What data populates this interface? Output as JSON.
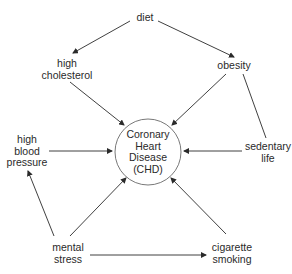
{
  "diagram": {
    "center_node": {
      "id": "chd",
      "lines": [
        "Coronary",
        "Heart",
        "Disease",
        "(CHD)"
      ]
    },
    "nodes": [
      {
        "id": "diet",
        "lines": [
          "diet"
        ]
      },
      {
        "id": "high-cholesterol",
        "lines": [
          "high",
          "cholesterol"
        ]
      },
      {
        "id": "obesity",
        "lines": [
          "obesity"
        ]
      },
      {
        "id": "high-blood-pressure",
        "lines": [
          "high",
          "blood",
          "pressure"
        ]
      },
      {
        "id": "sedentary-life",
        "lines": [
          "sedentary",
          "life"
        ]
      },
      {
        "id": "mental-stress",
        "lines": [
          "mental",
          "stress"
        ]
      },
      {
        "id": "cigarette-smoking",
        "lines": [
          "cigarette",
          "smoking"
        ]
      }
    ],
    "edges": [
      {
        "from": "diet",
        "to": "high-cholesterol"
      },
      {
        "from": "diet",
        "to": "obesity"
      },
      {
        "from": "high-cholesterol",
        "to": "chd"
      },
      {
        "from": "obesity",
        "to": "chd"
      },
      {
        "from": "obesity",
        "to": "sedentary-life",
        "arrow": false
      },
      {
        "from": "high-blood-pressure",
        "to": "chd"
      },
      {
        "from": "sedentary-life",
        "to": "chd"
      },
      {
        "from": "mental-stress",
        "to": "high-blood-pressure"
      },
      {
        "from": "mental-stress",
        "to": "chd"
      },
      {
        "from": "cigarette-smoking",
        "to": "chd"
      },
      {
        "from": "mental-stress",
        "to": "cigarette-smoking"
      }
    ],
    "colors": {
      "line": "#2a2a2a",
      "text": "#2a2a2a",
      "background": "#ffffff"
    }
  }
}
